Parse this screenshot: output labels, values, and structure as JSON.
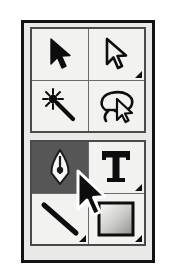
{
  "palette": {
    "name": "Tool Palette",
    "selected_tool": "pen-tool",
    "colors": {
      "frame": "#121212",
      "cell_background": "#f2f2f0",
      "selected_background": "#565656",
      "group_border": "#4a4a4a",
      "icon": "#101010",
      "page_background": "#ffffff"
    },
    "groups": [
      {
        "id": "selection-group",
        "tools": [
          {
            "id": "move-tool",
            "label": "Move Tool",
            "icon": "arrow-pointer-filled-icon",
            "selected": false,
            "has_flyout": false
          },
          {
            "id": "direct-selection-tool",
            "label": "Direct Selection Tool",
            "icon": "arrow-pointer-outline-icon",
            "selected": false,
            "has_flyout": true
          },
          {
            "id": "magic-wand-tool",
            "label": "Magic Wand Tool",
            "icon": "magic-wand-icon",
            "selected": false,
            "has_flyout": false
          },
          {
            "id": "lasso-tool",
            "label": "Lasso Tool",
            "icon": "lasso-icon",
            "selected": false,
            "has_flyout": false
          }
        ]
      },
      {
        "id": "drawing-group",
        "tools": [
          {
            "id": "pen-tool",
            "label": "Pen Tool",
            "icon": "pen-nib-icon",
            "selected": true,
            "has_flyout": true
          },
          {
            "id": "type-tool",
            "label": "Type Tool",
            "icon": "text-t-icon",
            "selected": false,
            "has_flyout": true
          },
          {
            "id": "line-tool",
            "label": "Line Tool",
            "icon": "diagonal-line-icon",
            "selected": false,
            "has_flyout": true
          },
          {
            "id": "gradient-tool",
            "label": "Gradient Tool",
            "icon": "gradient-square-icon",
            "selected": false,
            "has_flyout": true
          }
        ]
      }
    ],
    "cursor": {
      "id": "mouse-pointer",
      "label": "Mouse Cursor",
      "icon": "mouse-arrow-icon",
      "x": 72,
      "y": 168
    }
  }
}
